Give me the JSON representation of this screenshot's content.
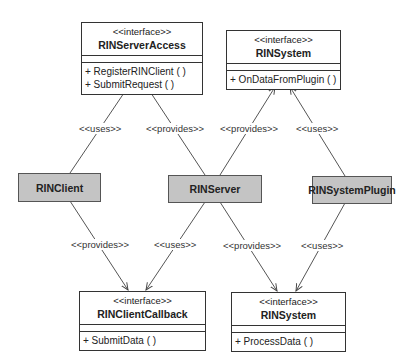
{
  "interfaces": {
    "server_access": {
      "stereotype": "<<interface>>",
      "name": "RINServerAccess",
      "operations": [
        "+ RegisterRINClient ( )",
        "+ SubmitRequest ( )"
      ]
    },
    "system_top": {
      "stereotype": "<<interface>>",
      "name": "RINSystem",
      "operations": [
        "+ OnDataFromPlugin ( )"
      ]
    },
    "client_callback": {
      "stereotype": "<<interface>>",
      "name": "RINClientCallback",
      "operations": [
        "+ SubmitData ( )"
      ]
    },
    "system_bottom": {
      "stereotype": "<<interface>>",
      "name": "RINSystem",
      "operations": [
        "+ ProcessData ( )"
      ]
    }
  },
  "components": {
    "client": "RINClient",
    "server": "RINServer",
    "plugin": "RINSystemPlugin"
  },
  "relations": [
    {
      "from": "RINClient",
      "to": "RINServerAccess",
      "label": "<<uses>>"
    },
    {
      "from": "RINServer",
      "to": "RINServerAccess",
      "label": "<<provides>>"
    },
    {
      "from": "RINServer",
      "to": "RINSystem (OnDataFromPlugin)",
      "label": "<<provides>>"
    },
    {
      "from": "RINSystemPlugin",
      "to": "RINSystem (OnDataFromPlugin)",
      "label": "<<uses>>"
    },
    {
      "from": "RINClient",
      "to": "RINClientCallback",
      "label": "<<provides>>"
    },
    {
      "from": "RINServer",
      "to": "RINClientCallback",
      "label": "<<uses>>"
    },
    {
      "from": "RINServer",
      "to": "RINSystem (ProcessData)",
      "label": "<<provides>>"
    },
    {
      "from": "RINSystemPlugin",
      "to": "RINSystem (ProcessData)",
      "label": "<<uses>>"
    }
  ],
  "colors": {
    "component_fill": "#c4c4c4",
    "line": "#444444",
    "interface_fill": "#ffffff"
  }
}
